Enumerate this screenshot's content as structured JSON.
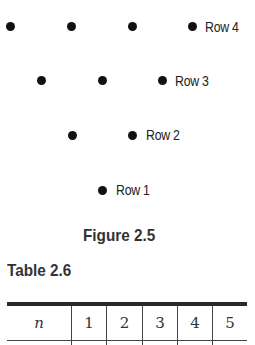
{
  "figure": {
    "caption": "Figure 2.5",
    "rows": [
      {
        "label": "Row 4",
        "dots": 4
      },
      {
        "label": "Row 3",
        "dots": 3
      },
      {
        "label": "Row 2",
        "dots": 2
      },
      {
        "label": "Row 1",
        "dots": 1
      }
    ]
  },
  "table": {
    "caption": "Table 2.6",
    "header": [
      "n",
      "1",
      "2",
      "3",
      "4",
      "5"
    ]
  }
}
